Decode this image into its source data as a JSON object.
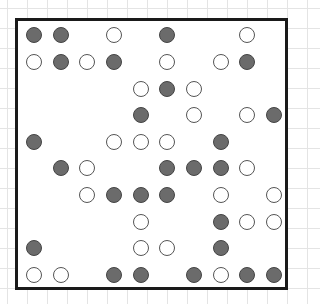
{
  "board": {
    "rows": 10,
    "cols": 10,
    "colors": {
      "filled": "#6b6b6b",
      "open": "#ffffff",
      "border": "#1a1a1a"
    },
    "grid": [
      [
        "F",
        "F",
        "",
        "O",
        "",
        "F",
        "",
        "",
        "O",
        ""
      ],
      [
        "O",
        "F",
        "O",
        "F",
        "",
        "O",
        "",
        "O",
        "F",
        ""
      ],
      [
        "",
        "",
        "",
        "",
        "O",
        "F",
        "O",
        "",
        "",
        ""
      ],
      [
        "",
        "",
        "",
        "",
        "F",
        "",
        "O",
        "",
        "O",
        "F"
      ],
      [
        "F",
        "",
        "",
        "O",
        "O",
        "O",
        "",
        "F",
        "",
        ""
      ],
      [
        "",
        "F",
        "O",
        "",
        "",
        "F",
        "F",
        "F",
        "O",
        ""
      ],
      [
        "",
        "",
        "O",
        "F",
        "F",
        "F",
        "",
        "O",
        "",
        "O"
      ],
      [
        "",
        "",
        "",
        "",
        "O",
        "",
        "",
        "F",
        "O",
        "O"
      ],
      [
        "F",
        "",
        "",
        "",
        "O",
        "O",
        "",
        "F",
        "",
        ""
      ],
      [
        "O",
        "O",
        "",
        "F",
        "F",
        "",
        "F",
        "O",
        "F",
        "F"
      ]
    ]
  }
}
